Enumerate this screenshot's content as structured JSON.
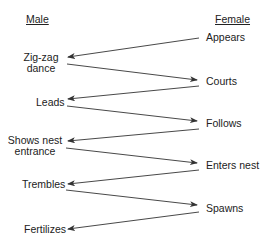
{
  "headers": {
    "male": "Male",
    "female": "Female"
  },
  "male_actions": [
    {
      "label": "Zig-zag",
      "label2": "dance"
    },
    {
      "label": "Leads"
    },
    {
      "label": "Shows nest",
      "label2": "entrance"
    },
    {
      "label": "Trembles"
    },
    {
      "label": "Fertilizes"
    }
  ],
  "female_actions": [
    {
      "label": "Appears"
    },
    {
      "label": "Courts"
    },
    {
      "label": "Follows"
    },
    {
      "label": "Enters nest"
    },
    {
      "label": "Spawns"
    }
  ],
  "colors": {
    "line": "#333333",
    "text": "#222222"
  }
}
